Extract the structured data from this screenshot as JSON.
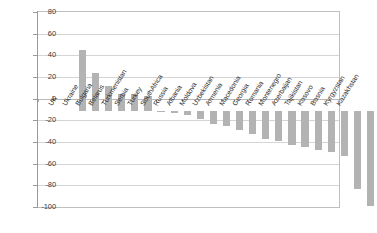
{
  "chart_data": {
    "type": "bar",
    "title": "",
    "subtitle": "",
    "xlabel": "",
    "ylabel": "",
    "ylim": [
      -100,
      80
    ],
    "ytick_step": 20,
    "yticks": [
      80,
      60,
      40,
      20,
      0,
      -20,
      -40,
      -60,
      -80,
      -100
    ],
    "ytick_labels": [
      "80",
      "60",
      "40",
      "20",
      "0",
      "-20",
      "-40",
      "-60",
      "-80",
      "-100"
    ],
    "grid": true,
    "legend": false,
    "legend_position": "none",
    "bar_color": "#b3b3b3",
    "categories": [
      "UK",
      "Ukraine",
      "Bulgaria",
      "Belarus",
      "Turkmenistan",
      "Serbia",
      "Turkey",
      "SouthAfrica",
      "Russia",
      "Albania",
      "Moldova",
      "Uzbekistan",
      "Armenia",
      "Macedonia",
      "Georgia",
      "Romania",
      "Montenegro",
      "Azerbaijan",
      "Tajikistan",
      "Kosovo",
      "Bosnia",
      "Kyrgyzstan",
      "Kazakhstan"
    ],
    "values": [
      56,
      35,
      23,
      15,
      15,
      14,
      -1,
      -2,
      -4,
      -8,
      -12,
      -14,
      -18,
      -22,
      -26,
      -28,
      -32,
      -34,
      -36,
      -38,
      -42,
      -72,
      -88
    ]
  },
  "axes": {
    "y_axis_name": "y-axis",
    "x_axis_name": "x-axis"
  }
}
